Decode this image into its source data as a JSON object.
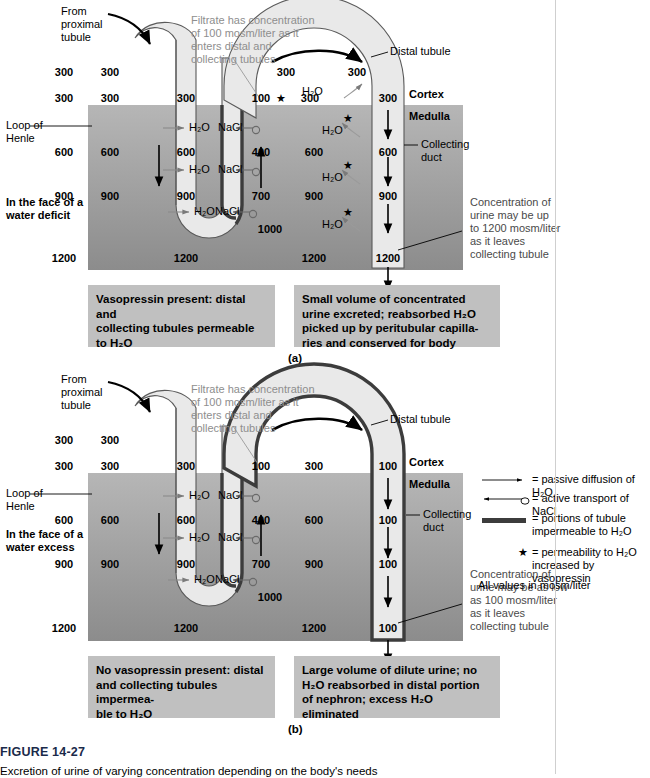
{
  "figure": {
    "number": "FIGURE 14-27",
    "caption": "Excretion of urine of varying concentration depending on the body's needs",
    "units_note": "All values in mosm/liter"
  },
  "panels": [
    {
      "id": "a",
      "letter": "(a)",
      "condition_label": "In the face of a\nwater deficit",
      "inflow_label": "From\nproximal\ntubule",
      "filtrate_note": "Filtrate has concentration\nof 100 mosm/liter as it\nenters distal and\ncollecting tubules",
      "distal_tubule_label": "Distal tubule",
      "collecting_duct_label": "Collecting\nduct",
      "loop_label": "Loop of\nHenle",
      "cortex_label": "Cortex",
      "medulla_label": "Medulla",
      "interstitial_values": [
        "300",
        "300",
        "600",
        "900",
        "1200"
      ],
      "descending_limb_values": [
        "300",
        "300",
        "600",
        "900"
      ],
      "loop_interstitial_values": [
        "300",
        "600",
        "900",
        "1200"
      ],
      "ascending_limb_values": [
        "100",
        "400",
        "700",
        "1000"
      ],
      "distal_top_values": [
        "300",
        "300"
      ],
      "distal_entry_values": [
        "100",
        "300",
        "300"
      ],
      "duct_interstitial_values": [
        "300",
        "600",
        "900",
        "1200"
      ],
      "duct_values": [
        "300",
        "600",
        "900",
        "1200"
      ],
      "h2o_markers": [
        "H₂O",
        "H₂O",
        "H₂O"
      ],
      "nacl_markers": [
        "NaCl",
        "NaCl",
        "NaCl"
      ],
      "duct_h2o_markers": [
        "H₂O",
        "H₂O",
        "H₂O",
        "H₂O"
      ],
      "urine_note": "Concentration of\nurine may be up\nto 1200 mosm/liter\nas it leaves\ncollecting tubule",
      "caption_left": "Vasopressin present: distal and\ncollecting tubules permeable\nto H₂O",
      "caption_right": "Small volume of concentrated\nurine excreted; reabsorbed H₂O\npicked up by peritubular capilla-\nries and conserved for body"
    },
    {
      "id": "b",
      "letter": "(b)",
      "condition_label": "In the face of a\nwater excess",
      "inflow_label": "From\nproximal\ntubule",
      "filtrate_note": "Filtrate has concentration\nof 100 mosm/liter as it\nenters distal and\ncollecting tubules",
      "distal_tubule_label": "Distal tubule",
      "collecting_duct_label": "Collecting\nduct",
      "loop_label": "Loop of\nHenle",
      "cortex_label": "Cortex",
      "medulla_label": "Medulla",
      "interstitial_values": [
        "300",
        "300",
        "600",
        "900",
        "1200"
      ],
      "descending_limb_values": [
        "300",
        "300",
        "600",
        "900"
      ],
      "loop_interstitial_values": [
        "300",
        "600",
        "900",
        "1200"
      ],
      "ascending_limb_values": [
        "100",
        "400",
        "700",
        "1000"
      ],
      "distal_entry_values": [
        "100",
        "300",
        "100"
      ],
      "duct_interstitial_values": [
        "300",
        "600",
        "900",
        "1200"
      ],
      "duct_values": [
        "100",
        "100",
        "100",
        "100"
      ],
      "h2o_markers": [
        "H₂O",
        "H₂O",
        "H₂O"
      ],
      "nacl_markers": [
        "NaCl",
        "NaCl",
        "NaCl"
      ],
      "urine_note": "Concentration of\nurine may be as low\nas 100 mosm/liter\nas it leaves\ncollecting tubule",
      "caption_left": "No vasopressin present: distal\nand collecting tubules impermea-\nble to H₂O",
      "caption_right": "Large volume of dilute urine; no\nH₂O reabsorbed in distal portion\nof nephron; excess H₂O eliminated"
    }
  ],
  "legend": {
    "items": [
      {
        "icon": "thin-arrow-right-icon",
        "text": "= passive diffusion of H₂O"
      },
      {
        "icon": "arrow-left-with-circle-icon",
        "text": "= active transport of NaCl"
      },
      {
        "icon": "thick-bar-icon",
        "text": "= portions of tubule\nimpermeable to H₂O"
      },
      {
        "icon": "star-icon",
        "text": "= permeability to H₂O\nincreased by vasopressin"
      }
    ],
    "footer": "All values in mosm/liter"
  },
  "colors": {
    "cortex_bg": "#ffffff",
    "medulla_top": "#b4b4b4",
    "medulla_bottom": "#8e8e8e",
    "tubule_fill": "#e8e8e8",
    "tubule_stroke": "#4d4d4d",
    "impermeable_stroke": "#3a3a3a",
    "caption_box_bg": "#c0c0c0",
    "note_text": "#8e8e8e"
  }
}
